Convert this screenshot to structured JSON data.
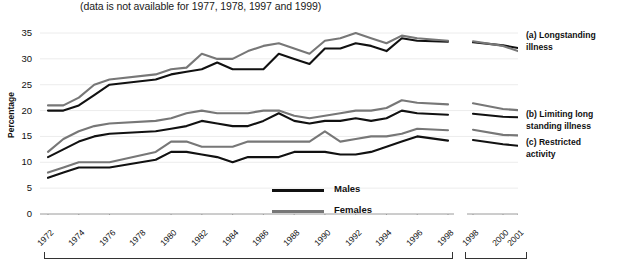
{
  "subtitle": "(data is not available for 1977, 1978, 1997 and 1999)",
  "axis": {
    "ylabel": "Percentage",
    "yticks": [
      "0",
      "5",
      "10",
      "15",
      "20",
      "25",
      "30",
      "35"
    ],
    "xticks_main": [
      "1972",
      "1974",
      "1976",
      "1978",
      "1980",
      "1982",
      "1984",
      "1986",
      "1988",
      "1990",
      "1992",
      "1994",
      "1996",
      "1998"
    ],
    "xticks_break": [
      "1998",
      "2000",
      "2001"
    ]
  },
  "legend": {
    "males_label": "Males",
    "females_label": "Females",
    "males_color": "#111111",
    "females_color": "#777777"
  },
  "series_labels": {
    "a_line1": "(a) Longstanding",
    "a_line2": "illness",
    "b_line1": "(b) Limiting long",
    "b_line2": "standing illness",
    "c_line1": "(c) Restricted",
    "c_line2": "activity"
  },
  "chart_data": {
    "type": "line",
    "subtitle": "(data is not available for 1977, 1978, 1997 and 1999)",
    "xlabel": "",
    "ylabel": "Percentage",
    "ylim": [
      0,
      35
    ],
    "grid": true,
    "legend_position": "bottom-center",
    "axis_break": true,
    "x_main": [
      1972,
      1973,
      1974,
      1975,
      1976,
      1979,
      1980,
      1981,
      1982,
      1983,
      1984,
      1985,
      1986,
      1987,
      1988,
      1989,
      1990,
      1991,
      1992,
      1993,
      1994,
      1995,
      1996,
      1998
    ],
    "x_break": [
      1998,
      2000,
      2001
    ],
    "panels": [
      {
        "name": "(a) Longstanding illness",
        "series": [
          {
            "name": "Males",
            "color": "#111111",
            "values_main": [
              20,
              20,
              21,
              23,
              25,
              26,
              27,
              27.5,
              28,
              29.3,
              28,
              28,
              28,
              31,
              30,
              29,
              32,
              32,
              33,
              32.5,
              31.5,
              34,
              33.5,
              33.3
            ],
            "values_break": [
              33.2,
              32.6,
              32.1
            ]
          },
          {
            "name": "Females",
            "color": "#777777",
            "values_main": [
              21,
              21,
              22.5,
              25,
              26,
              27,
              28,
              28.3,
              31,
              30,
              30,
              31.5,
              32.5,
              33,
              32,
              31,
              33.5,
              34,
              35,
              34,
              33,
              34.5,
              34,
              33.5
            ],
            "values_break": [
              33.4,
              32.5,
              31.5
            ]
          }
        ]
      },
      {
        "name": "(b) Limiting long standing illness",
        "series": [
          {
            "name": "Males",
            "color": "#111111",
            "values_main": [
              11,
              12.5,
              14,
              15,
              15.5,
              16,
              16.5,
              17,
              18,
              17.5,
              17,
              17,
              18,
              19.5,
              18,
              17.5,
              18,
              18,
              18.5,
              18,
              18.5,
              20,
              19.5,
              19.2
            ],
            "values_break": [
              19.4,
              18.8,
              18.7
            ]
          },
          {
            "name": "Females",
            "color": "#777777",
            "values_main": [
              12,
              14.5,
              16,
              17,
              17.5,
              18,
              18.5,
              19.5,
              20,
              19.5,
              19.5,
              19.5,
              20,
              20,
              19,
              18.5,
              19,
              19.5,
              20,
              20,
              20.5,
              22,
              21.5,
              21.2
            ],
            "values_break": [
              21.4,
              20.3,
              20.1
            ]
          }
        ]
      },
      {
        "name": "(c) Restricted activity",
        "series": [
          {
            "name": "Males",
            "color": "#111111",
            "values_main": [
              7,
              8,
              9,
              9,
              9,
              10.5,
              12,
              12,
              11.5,
              11,
              10,
              11,
              11,
              11,
              12,
              12,
              12,
              11.5,
              11.5,
              12,
              13,
              14,
              15,
              14.2
            ],
            "values_break": [
              14.3,
              13.5,
              13.2
            ]
          },
          {
            "name": "Females",
            "color": "#777777",
            "values_main": [
              8,
              9,
              10,
              10,
              10,
              12,
              14,
              14,
              13,
              13,
              13,
              14,
              14,
              14,
              14,
              14,
              16,
              14,
              14.5,
              15,
              15,
              15.5,
              16.5,
              16.2
            ],
            "values_break": [
              16.3,
              15.3,
              15.2
            ]
          }
        ]
      }
    ]
  }
}
